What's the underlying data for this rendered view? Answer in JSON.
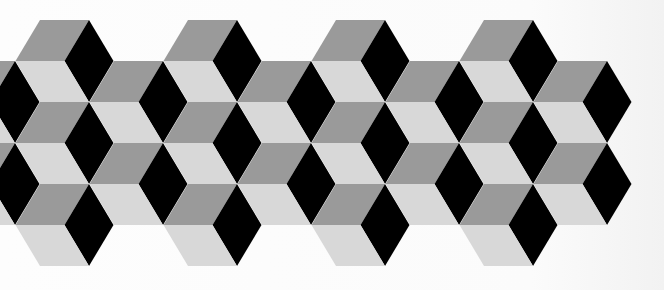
{
  "image": {
    "description": "Tumbling blocks (isometric cube) tiling pattern",
    "width": 664,
    "height": 290
  },
  "pattern": {
    "colors": {
      "top_face": "#9a9a9a",
      "right_face": "#000000",
      "left_face": "#d8d8d8",
      "background": "#fbfbfb"
    },
    "geometry": {
      "origin_x": 40,
      "origin_y": 20,
      "edge_width": 49,
      "half_width": 24.5,
      "row_height": 41,
      "column_step": 74
    },
    "cubes": [
      {
        "m": -1,
        "n": 1
      },
      {
        "m": -1,
        "n": 3
      },
      {
        "m": 0,
        "n": 0
      },
      {
        "m": 0,
        "n": 2
      },
      {
        "m": 0,
        "n": 4
      },
      {
        "m": 1,
        "n": 1
      },
      {
        "m": 1,
        "n": 3
      },
      {
        "m": 2,
        "n": 0
      },
      {
        "m": 2,
        "n": 2
      },
      {
        "m": 2,
        "n": 4
      },
      {
        "m": 3,
        "n": 1
      },
      {
        "m": 3,
        "n": 3
      },
      {
        "m": 4,
        "n": 0
      },
      {
        "m": 4,
        "n": 2
      },
      {
        "m": 4,
        "n": 4
      },
      {
        "m": 5,
        "n": 1
      },
      {
        "m": 5,
        "n": 3
      },
      {
        "m": 6,
        "n": 0
      },
      {
        "m": 6,
        "n": 2
      },
      {
        "m": 6,
        "n": 4
      },
      {
        "m": 7,
        "n": 1
      },
      {
        "m": 7,
        "n": 3
      }
    ]
  }
}
